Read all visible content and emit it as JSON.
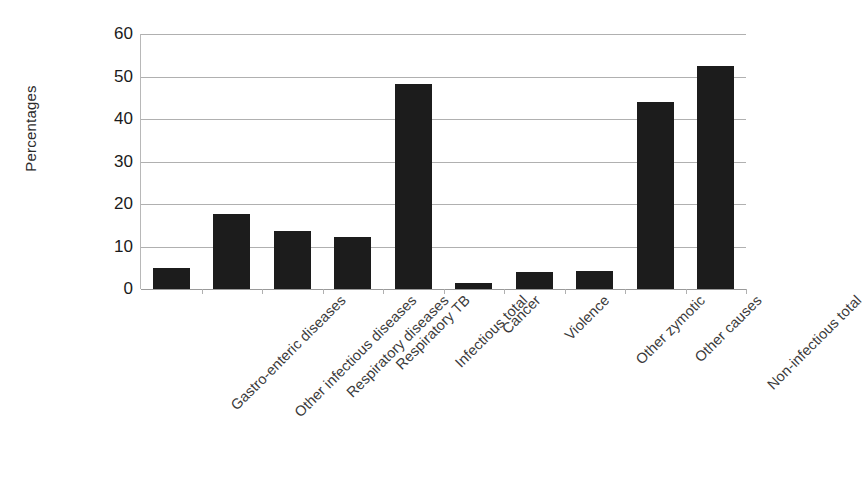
{
  "chart_data": {
    "type": "bar",
    "title": "",
    "xlabel": "",
    "ylabel": "Percentages",
    "ylim": [
      0,
      60
    ],
    "yticks": [
      0,
      10,
      20,
      30,
      40,
      50,
      60
    ],
    "ytick_labels": [
      "0",
      "10",
      "20",
      "30",
      "40",
      "50",
      "60"
    ],
    "grid": "horizontal",
    "legend": "none",
    "bar_color": "#1c1c1c",
    "gridline_color": "#b0b0b0",
    "background_color": "#ffffff",
    "label_rotation_degrees": 45,
    "categories": [
      "Gastro-enteric diseases",
      "Other infectious diseases",
      "Respiratory diseases",
      "Respiratory TB",
      "Infectious total",
      "Cancer",
      "Violence",
      "Other zymotic",
      "Other causes",
      "Non-infectious total"
    ],
    "values": [
      5.0,
      17.7,
      13.7,
      12.2,
      48.2,
      1.5,
      4.0,
      4.2,
      44.0,
      52.5
    ]
  }
}
